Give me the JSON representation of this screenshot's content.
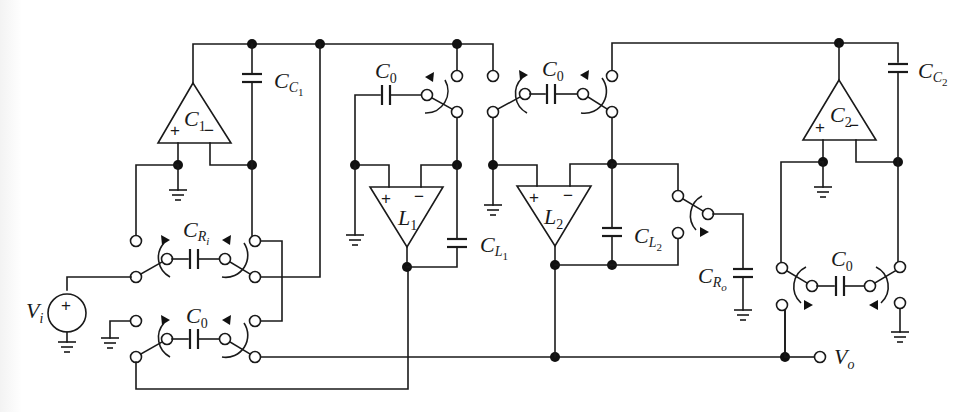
{
  "figure": {
    "colors": {
      "ink": "#1a1a1a",
      "background": "#ffffff"
    }
  },
  "opamps": [
    {
      "id": "C1",
      "label": "C",
      "sub": "1",
      "plus": "+",
      "minus": "−"
    },
    {
      "id": "L1",
      "label": "L",
      "sub": "1",
      "plus": "+",
      "minus": "−"
    },
    {
      "id": "L2",
      "label": "L",
      "sub": "2",
      "plus": "+",
      "minus": "−"
    },
    {
      "id": "C2",
      "label": "C",
      "sub": "2",
      "plus": "+",
      "minus": "−"
    }
  ],
  "capacitors": {
    "cc1": {
      "label": "C",
      "sub": "C",
      "subsub": "1"
    },
    "cc2": {
      "label": "C",
      "sub": "C",
      "subsub": "2"
    },
    "cl1": {
      "label": "C",
      "sub": "L",
      "subsub": "1"
    },
    "cl2": {
      "label": "C",
      "sub": "L",
      "subsub": "2"
    },
    "cri": {
      "label": "C",
      "sub": "R",
      "subsub": "i"
    },
    "cro": {
      "label": "C",
      "sub": "R",
      "subsub": "o"
    },
    "c0_input": {
      "label": "C",
      "sub": "0"
    },
    "c0_l1": {
      "label": "C",
      "sub": "0"
    },
    "c0_l2": {
      "label": "C",
      "sub": "0"
    },
    "c0_output": {
      "label": "C",
      "sub": "0"
    }
  },
  "sources": {
    "vi": {
      "label": "V",
      "sub": "i",
      "sign": "+"
    }
  },
  "ports": {
    "vo": {
      "label": "V",
      "sub": "o"
    }
  }
}
